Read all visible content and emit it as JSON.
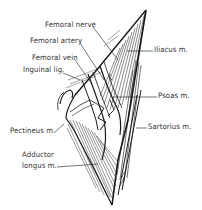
{
  "figure": {
    "ink_color": "#1a1a1a",
    "background": "#ffffff"
  },
  "labels": {
    "femoral_nerve": "Femoral nerve",
    "femoral_artery": "Femoral artery",
    "femoral_vein": "Femoral vein",
    "inguinal_lig": "Inguinal lig.",
    "iliacus": "Iliacus m.",
    "psoas": "Psoas m.",
    "pectineus": "Pectineus m.",
    "sartorius": "Sartorius m.",
    "adductor_line1": "Adductor",
    "adductor_line2": "longus m."
  }
}
